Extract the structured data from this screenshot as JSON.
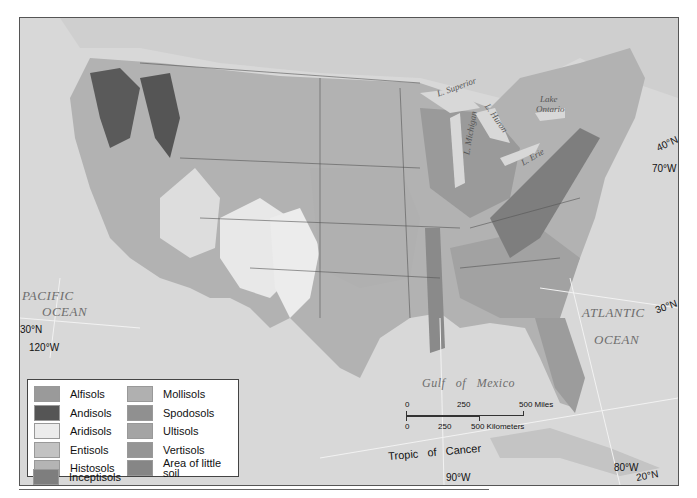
{
  "map": {
    "title": "Soil orders of the conterminous United States",
    "oceans": {
      "pacific_line1": "PACIFIC",
      "pacific_line2": "OCEAN",
      "atlantic_line1": "ATLANTIC",
      "atlantic_line2": "OCEAN",
      "gulf": "Gulf   of   Mexico"
    },
    "lakes": {
      "superior": "L. Superior",
      "michigan": "L. Michigan",
      "huron": "L. Huron",
      "erie": "L. Erie",
      "ontario_line1": "Lake",
      "ontario_line2": "Ontario"
    },
    "coordinates": {
      "lat_40n": "40°N",
      "lon_70w": "70°W",
      "lat_30n_west": "30°N",
      "lon_120w": "120°W",
      "lat_30n_east": "30°N",
      "lon_90w": "90°W",
      "lon_80w": "80°W",
      "lat_20n": "20°N"
    },
    "tropic": "Tropic   of   Cancer",
    "scale": {
      "miles_0": "0",
      "miles_250": "250",
      "miles_500": "500 Miles",
      "km_0": "0",
      "km_250": "250",
      "km_500": "500 Kilometers"
    }
  },
  "legend": {
    "left": [
      {
        "label": "Alfisols",
        "color": "#9a9a9a"
      },
      {
        "label": "Andisols",
        "color": "#555555"
      },
      {
        "label": "Aridisols",
        "color": "#ececec"
      },
      {
        "label": "Entisols",
        "color": "#c2c2c2"
      },
      {
        "label": "Histosols",
        "color": "#b4b4b4"
      },
      {
        "label": "Inceptisols",
        "color": "#7e7e7e"
      }
    ],
    "right": [
      {
        "label": "Mollisols",
        "color": "#b0b0b0"
      },
      {
        "label": "Spodosols",
        "color": "#909090"
      },
      {
        "label": "Ultisols",
        "color": "#a4a4a4"
      },
      {
        "label": "Vertisols",
        "color": "#959595"
      },
      {
        "label": "Area of little soil",
        "color": "#868686"
      }
    ]
  },
  "colors": {
    "water": "#d9d9d9",
    "land_base": "#b5b5b5",
    "border": "#444444"
  }
}
